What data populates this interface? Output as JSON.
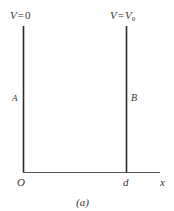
{
  "diagram": {
    "caption": "(a)",
    "colors": {
      "line": "#2a2a2a",
      "text": "#333333",
      "background": "#ffffff"
    },
    "plates": [
      {
        "id": "A",
        "label": "A",
        "potential_label": "V = 0",
        "position": "O"
      },
      {
        "id": "B",
        "label": "B",
        "potential_label": "V = V0",
        "position": "d"
      }
    ],
    "axis": {
      "origin_label": "O",
      "tick_label": "d",
      "axis_label": "x"
    },
    "labels": {
      "left_V": "V",
      "left_eq": "=",
      "left_val": "0",
      "right_V": "V",
      "right_eq": "=",
      "right_val": "V",
      "right_sub": "0",
      "plate_a": "A",
      "plate_b": "B",
      "origin": "O",
      "d": "d",
      "x": "x",
      "caption": "(a)"
    }
  }
}
